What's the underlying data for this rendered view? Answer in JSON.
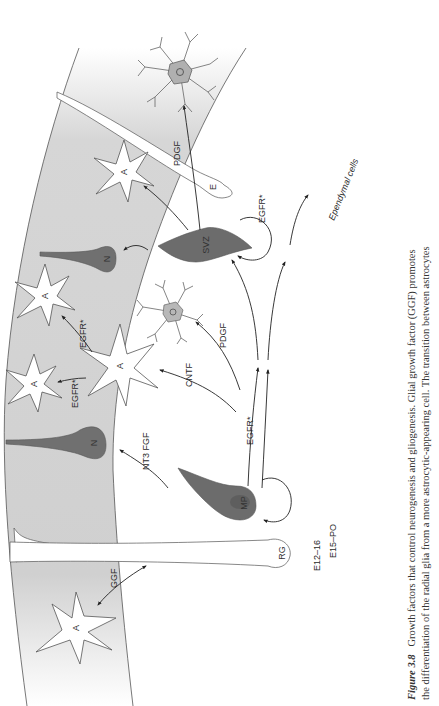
{
  "figure": {
    "number_label": "Figure 3.8",
    "caption_lines": [
      "Growth factors that control neurogenesis and gliogenesis. Glial growth factor (GGF) promotes",
      "the differentiation of the radial glia from a more astrocytic-appearing cell. The transition between astrocytes"
    ],
    "orientation": "rotated 90° counter-clockwise"
  },
  "cells": {
    "astrocyte_label": "A",
    "neuron_label": "N",
    "oligodendrocyte_label": "O",
    "radial_glia_label": "RG",
    "ependymal_label": "E",
    "multipotent_progenitor_label": "MP",
    "svz_label": "SVZ"
  },
  "factors": {
    "ggf": "GGF",
    "nt3_fgf": "NT3 FGF",
    "cntf": "CNTF",
    "pdgf_upper": "PDGF",
    "pdgf_top": "PDGF",
    "egfr_main": "EGFR*",
    "egfr_astro_1": "EGFR*",
    "egfr_astro_2": "EGFR*",
    "egfr_svz": "EGFR*"
  },
  "stages": {
    "early": "E12–16",
    "late": "E15–PO"
  },
  "annotations": {
    "ependymal_cells": "Ependymal cells"
  },
  "colors": {
    "tissue_gray": "#d2d2d2",
    "cell_dark": "#707070",
    "outline": "#555555",
    "background": "#ffffff"
  }
}
